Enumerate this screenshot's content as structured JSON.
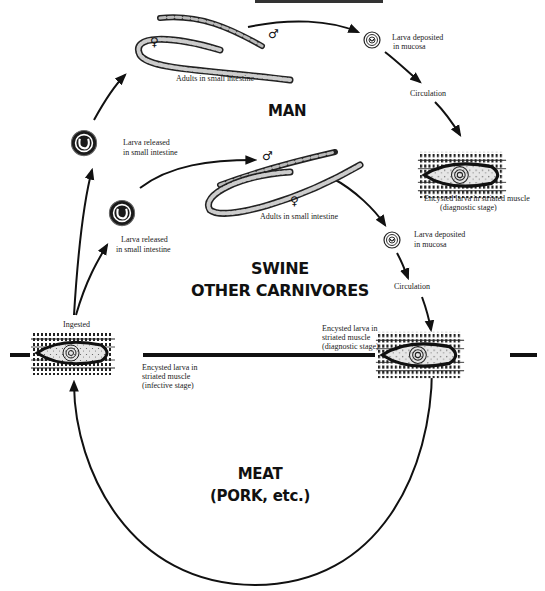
{
  "diagram": {
    "type": "life-cycle",
    "hosts": {
      "man": "MAN",
      "swine_line1": "SWINE",
      "swine_line2": "OTHER CARNIVORES",
      "meat_line1": "MEAT",
      "meat_line2": "(PORK, etc.)"
    },
    "labels": {
      "man_adults": "Adults in small intestine",
      "man_larva_deposited_1": "Larva deposited",
      "man_larva_deposited_2": "in mucosa",
      "man_circulation": "Circulation",
      "man_encysted_1": "Encysted larva in striated muscle",
      "man_encysted_2": "(diagnostic stage)",
      "man_larva_released_1": "Larva released",
      "man_larva_released_2": "in small intestine",
      "swine_larva_released_1": "Larva released",
      "swine_larva_released_2": "in small intestine",
      "swine_adults": "Adults in small intestine",
      "swine_larva_deposited_1": "Larva deposited",
      "swine_larva_deposited_2": "in mucosa",
      "swine_circulation": "Circulation",
      "ingested": "Ingested",
      "infective_1": "Encysted larva in",
      "infective_2": "striated muscle",
      "infective_3": "(infective stage)",
      "swine_encysted_1": "Encysted larva in",
      "swine_encysted_2": "striated muscle",
      "swine_encysted_3": "(diagnostic stage)"
    },
    "symbols": {
      "male": "♂",
      "female": "♀"
    },
    "nodes": [
      {
        "id": "ingested-cyst",
        "icon": "encysted-larva-muscle-icon"
      },
      {
        "id": "man-released-larva",
        "icon": "coiled-larva-icon"
      },
      {
        "id": "man-adults",
        "icon": "adult-worms-icon"
      },
      {
        "id": "man-deposited-larva",
        "icon": "coiled-larva-icon"
      },
      {
        "id": "man-encysted",
        "icon": "encysted-larva-muscle-icon"
      },
      {
        "id": "swine-released-larva",
        "icon": "coiled-larva-icon"
      },
      {
        "id": "swine-adults",
        "icon": "adult-worms-icon"
      },
      {
        "id": "swine-deposited-larva",
        "icon": "coiled-larva-icon"
      },
      {
        "id": "swine-encysted",
        "icon": "encysted-larva-muscle-icon"
      }
    ],
    "colors": {
      "ink": "#111111",
      "background": "#ffffff",
      "cyst_fill": "#d8d8d8"
    }
  }
}
